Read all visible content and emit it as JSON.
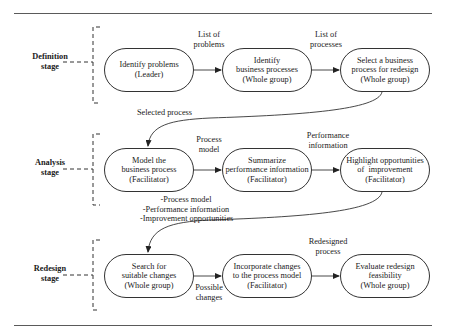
{
  "diagram": {
    "stages": [
      {
        "label_line1": "Definition",
        "label_line2": "stage",
        "steps": [
          {
            "line1": "Identify problems",
            "line2": "(Leader)",
            "line3": ""
          },
          {
            "line1": "Identify",
            "line2": "business processes",
            "line3": "(Whole group)"
          },
          {
            "line1": "Select a business",
            "line2": "process for redesign",
            "line3": "(Whole group)"
          }
        ],
        "flow_labels": [
          {
            "line1": "List of",
            "line2": "problems"
          },
          {
            "line1": "List of",
            "line2": "processes"
          }
        ]
      },
      {
        "label_line1": "Analysis",
        "label_line2": "stage",
        "steps": [
          {
            "line1": "Model the",
            "line2": "business process",
            "line3": "(Facilitator)"
          },
          {
            "line1": "Summarize",
            "line2": "performance information",
            "line3": "(Facilitator)"
          },
          {
            "line1": "Highlight opportunities",
            "line2": "of  improvement",
            "line3": "(Facilitator)"
          }
        ],
        "flow_labels": [
          {
            "line1": "Process",
            "line2": "model"
          },
          {
            "line1": "Performance",
            "line2": "information"
          }
        ]
      },
      {
        "label_line1": "Redesign",
        "label_line2": "stage",
        "steps": [
          {
            "line1": "Search for",
            "line2": "suitable changes",
            "line3": "(Whole group)"
          },
          {
            "line1": "Incorporate changes",
            "line2": "to the process model",
            "line3": "(Facilitator)"
          },
          {
            "line1": "Evaluate redesign",
            "line2": "feasibility",
            "line3": "(Whole group)"
          }
        ],
        "flow_labels": [
          {
            "line1": "Possible",
            "line2": "changes"
          },
          {
            "line1": "Redesigned",
            "line2": "process"
          }
        ]
      }
    ],
    "transitions": {
      "definition_to_analysis": "Selected process",
      "analysis_to_redesign": {
        "line1": "-Process model",
        "line2": "-Performance information",
        "line3": "-Improvement opportunities"
      }
    }
  }
}
